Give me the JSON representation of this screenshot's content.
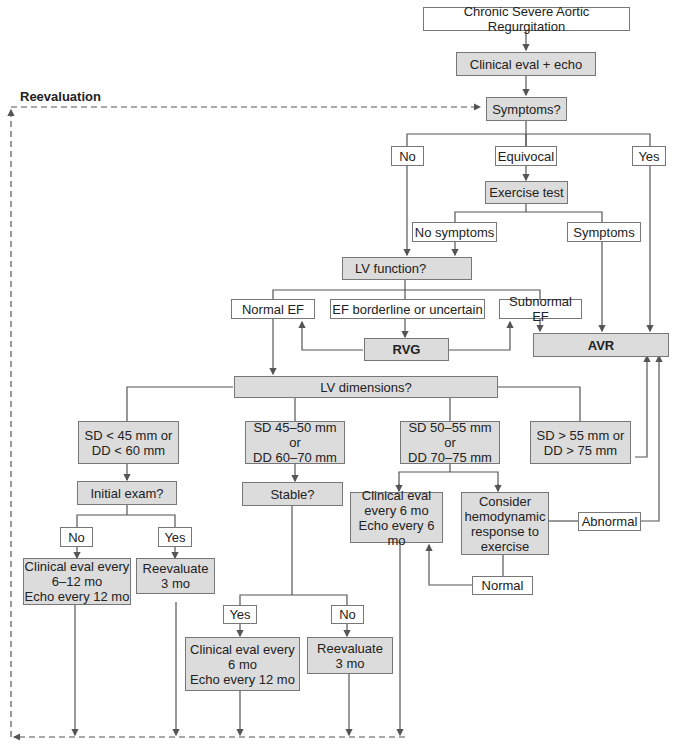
{
  "title": "Chronic Severe Aortic Regurgitation",
  "reevaluation_label": "Reevaluation",
  "colors": {
    "process_fill": "#dcdcdc",
    "label_fill": "#ffffff",
    "line": "#555555",
    "border": "#777777"
  },
  "nodes": {
    "start": "Chronic Severe Aortic Regurgitation",
    "clinical_eval": "Clinical eval + echo",
    "symptoms_q": "Symptoms?",
    "no": "No",
    "equivocal": "Equivocal",
    "yes": "Yes",
    "exercise_test": "Exercise test",
    "no_symptoms": "No symptoms",
    "symptoms": "Symptoms",
    "lv_function_q": "LV function?",
    "normal_ef": "Normal EF",
    "ef_borderline": "EF borderline or uncertain",
    "subnormal_ef": "Subnormal EF",
    "rvg": "RVG",
    "avr": "AVR",
    "lv_dimensions_q": "LV dimensions?",
    "dim1": "SD < 45 mm or\nDD < 60 mm",
    "dim2": "SD 45–50 mm or\nDD 60–70 mm",
    "dim3": "SD 50–55 mm or\nDD 70–75 mm",
    "dim4": "SD > 55 mm or\nDD > 75 mm",
    "initial_exam_q": "Initial exam?",
    "ie_no": "No",
    "ie_yes": "Yes",
    "ie_no_action": "Clinical eval every\n6–12 mo\nEcho every 12 mo",
    "ie_yes_action": "Reevaluate\n3 mo",
    "stable_q": "Stable?",
    "st_yes": "Yes",
    "st_no": "No",
    "st_yes_action": "Clinical eval every\n6 mo\nEcho every 12 mo",
    "st_no_action": "Reevaluate\n3 mo",
    "d3_action": "Clinical eval\nevery 6 mo\nEcho every 6 mo",
    "consider_hemo": "Consider\nhemodynamic\nresponse to\nexercise",
    "abnormal": "Abnormal",
    "normal": "Normal"
  }
}
